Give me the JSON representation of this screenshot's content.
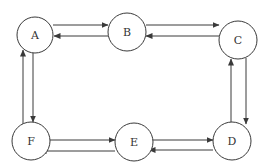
{
  "diagram": {
    "type": "directed-graph",
    "colors": {
      "stroke": "#3a3a3a",
      "background": "#ffffff",
      "label": "#333333"
    },
    "nodes": [
      {
        "id": "A",
        "label": "A",
        "cx": 35,
        "cy": 35,
        "r": 18
      },
      {
        "id": "B",
        "label": "B",
        "cx": 127,
        "cy": 32,
        "r": 19
      },
      {
        "id": "C",
        "label": "C",
        "cx": 238,
        "cy": 40,
        "r": 19
      },
      {
        "id": "D",
        "label": "D",
        "cx": 232,
        "cy": 141,
        "r": 19
      },
      {
        "id": "E",
        "label": "E",
        "cx": 134,
        "cy": 142,
        "r": 19
      },
      {
        "id": "F",
        "label": "F",
        "cx": 31,
        "cy": 141,
        "r": 19
      }
    ],
    "edges": [
      {
        "from": "A",
        "to": "B"
      },
      {
        "from": "B",
        "to": "A"
      },
      {
        "from": "B",
        "to": "C"
      },
      {
        "from": "C",
        "to": "B"
      },
      {
        "from": "C",
        "to": "D"
      },
      {
        "from": "D",
        "to": "C"
      },
      {
        "from": "D",
        "to": "E"
      },
      {
        "from": "E",
        "to": "D"
      },
      {
        "from": "E",
        "to": "F"
      },
      {
        "from": "F",
        "to": "E"
      },
      {
        "from": "A",
        "to": "F"
      },
      {
        "from": "F",
        "to": "A"
      }
    ]
  }
}
